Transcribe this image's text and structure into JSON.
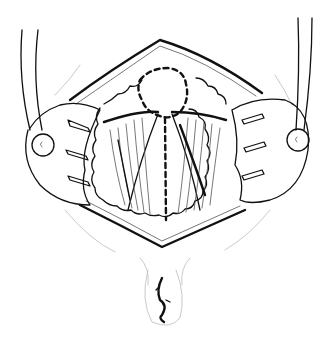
{
  "figure": {
    "type": "surgical-line-illustration",
    "background_color": "#ffffff",
    "ink_color": "#111111",
    "elements": [
      "diamond-shaped-incision",
      "left-retractor",
      "right-retractor",
      "circular-dashed-outline",
      "vertical-dashed-line",
      "muscle-fibers",
      "fatty-tissue-border",
      "lower-orifice"
    ],
    "retractor_marks": [
      "c",
      "c"
    ]
  }
}
